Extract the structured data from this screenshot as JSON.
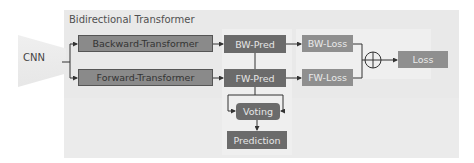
{
  "diagram": {
    "title": "Bidirectional Transformer",
    "nodes": {
      "cnn": "CNN",
      "backward_transformer": "Backward-Transformer",
      "forward_transformer": "Forward-Transformer",
      "bw_pred": "BW-Pred",
      "fw_pred": "FW-Pred",
      "bw_loss": "BW-Loss",
      "fw_loss": "FW-Loss",
      "sum": "⊕",
      "loss": "Loss",
      "voting": "Voting",
      "prediction": "Prediction"
    },
    "edges": [
      [
        "CNN",
        "Backward-Transformer"
      ],
      [
        "CNN",
        "Forward-Transformer"
      ],
      [
        "Backward-Transformer",
        "BW-Pred"
      ],
      [
        "Forward-Transformer",
        "FW-Pred"
      ],
      [
        "BW-Pred",
        "BW-Loss"
      ],
      [
        "FW-Pred",
        "FW-Loss"
      ],
      [
        "BW-Loss",
        "⊕"
      ],
      [
        "FW-Loss",
        "⊕"
      ],
      [
        "⊕",
        "Loss"
      ],
      [
        "BW-Pred",
        "Voting"
      ],
      [
        "FW-Pred",
        "Voting"
      ],
      [
        "Voting",
        "Prediction"
      ]
    ]
  }
}
